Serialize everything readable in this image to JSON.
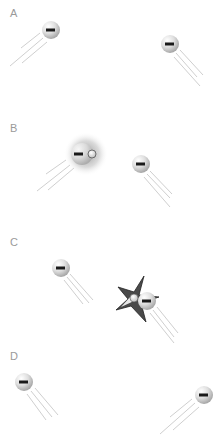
{
  "diagram": {
    "type": "particle-interaction-sequence",
    "panels": [
      {
        "label": "A",
        "label_pos": [
          10,
          17
        ],
        "particles": [
          {
            "charge": "-",
            "cx": 51,
            "cy": 30,
            "r": 9,
            "direction": "up-right"
          },
          {
            "charge": "-",
            "cx": 170,
            "cy": 44,
            "r": 9,
            "direction": "up-left"
          }
        ]
      },
      {
        "label": "B",
        "label_pos": [
          10,
          132
        ],
        "particles": [
          {
            "charge": "-",
            "cx": 82,
            "cy": 154,
            "r": 11,
            "direction": "up-right",
            "glow": true,
            "bound_positive": {
              "cx": 92,
              "cy": 154,
              "r": 4
            }
          },
          {
            "charge": "-",
            "cx": 141,
            "cy": 164,
            "r": 9,
            "direction": "up-left"
          }
        ]
      },
      {
        "label": "C",
        "label_pos": [
          10,
          246
        ],
        "particles": [
          {
            "charge": "-",
            "cx": 61,
            "cy": 268,
            "r": 9,
            "direction": "up-left"
          },
          {
            "charge": "-",
            "cx": 147,
            "cy": 301,
            "r": 9,
            "direction": "up-left",
            "collision": true,
            "bound_positive": {
              "cx": 134,
              "cy": 298,
              "r": 4
            }
          }
        ]
      },
      {
        "label": "D",
        "label_pos": [
          10,
          360
        ],
        "particles": [
          {
            "charge": "-",
            "cx": 24,
            "cy": 382,
            "r": 9,
            "direction": "up-left"
          },
          {
            "charge": "-",
            "cx": 204,
            "cy": 395,
            "r": 9,
            "direction": "up-right"
          }
        ]
      }
    ],
    "colors": {
      "particle_light": "#f4f4f4",
      "particle_dark": "#a8a8a8",
      "minus_sign": "#1a1a1a",
      "trail": "#cfcfcf",
      "star_fill": "#4a4a4a",
      "label": "#9a9a9a"
    }
  }
}
